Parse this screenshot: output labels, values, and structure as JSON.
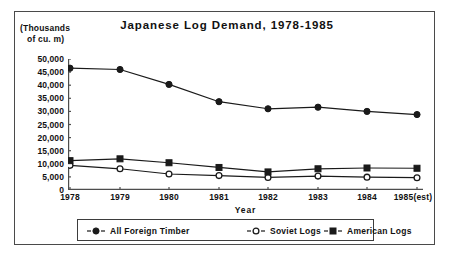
{
  "chart_data": {
    "type": "line",
    "title": "Japanese  Log  Demand,  1978-1985",
    "xlabel": "Year",
    "ylabel": "(Thousands of cu. m)",
    "ylabel_line1": "(Thousands",
    "ylabel_line2": "of  cu.  m)",
    "categories": [
      "1978",
      "1979",
      "1980",
      "1981",
      "1982",
      "1983",
      "1984",
      "1985(est)"
    ],
    "x": [
      1978,
      1979,
      1980,
      1981,
      1982,
      1983,
      1984,
      1985
    ],
    "ylim": [
      0,
      50000
    ],
    "yticks": [
      0,
      5000,
      10000,
      15000,
      20000,
      25000,
      30000,
      35000,
      40000,
      45000,
      50000
    ],
    "ytick_labels": [
      "0",
      "5,000",
      "10,000",
      "15,000",
      "20,000",
      "25,000",
      "30,000",
      "35,000",
      "40,000",
      "45,000",
      "50,000"
    ],
    "grid": false,
    "legend_position": "bottom",
    "series": [
      {
        "name": "All Foreign Timber",
        "marker": "filled-circle",
        "values": [
          46500,
          46000,
          40300,
          33700,
          31000,
          31600,
          30000,
          28800
        ]
      },
      {
        "name": "Soviet Logs",
        "marker": "open-circle",
        "values": [
          9400,
          8100,
          6100,
          5500,
          4800,
          5300,
          4900,
          4700
        ]
      },
      {
        "name": "American Logs",
        "marker": "filled-square",
        "values": [
          11200,
          11900,
          10400,
          8600,
          6900,
          8100,
          8400,
          8300
        ]
      }
    ]
  },
  "legend": {
    "items": [
      {
        "label": "All Foreign Timber",
        "marker": "filled-circle"
      },
      {
        "label": "Soviet Logs",
        "marker": "open-circle"
      },
      {
        "label": "American Logs",
        "marker": "filled-square"
      }
    ]
  },
  "colors": {
    "line": "#1a1a1a",
    "axis": "#4d4d4d",
    "frame": "#4a4a4a",
    "text": "#111111",
    "background": "#ffffff"
  }
}
